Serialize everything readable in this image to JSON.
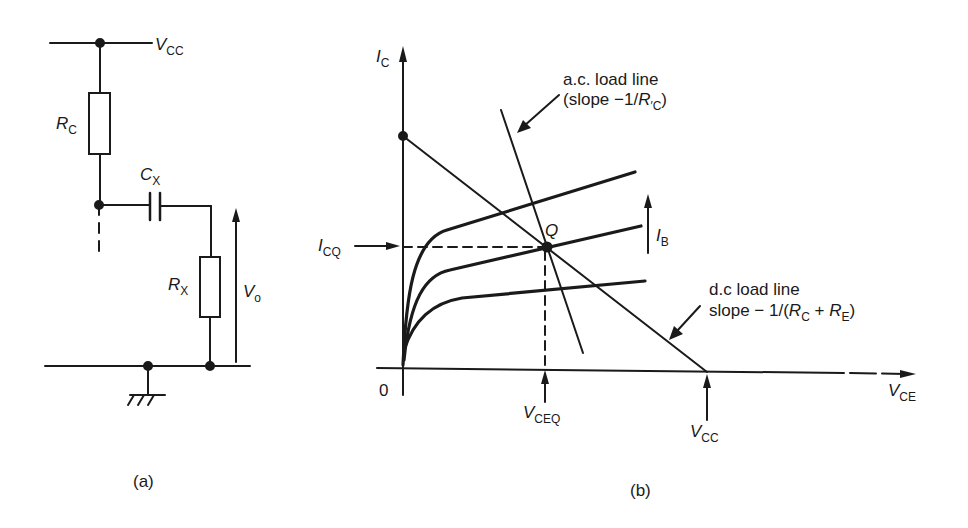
{
  "figure_a": {
    "caption": "(a)",
    "labels": {
      "vcc": {
        "main": "V",
        "sub": "CC"
      },
      "rc": {
        "main": "R",
        "sub": "C"
      },
      "cx": {
        "main": "C",
        "sub": "X"
      },
      "rx": {
        "main": "R",
        "sub": "X"
      },
      "vo": {
        "main": "V",
        "sub": "o"
      }
    }
  },
  "figure_b": {
    "caption": "(b)",
    "axes": {
      "y": {
        "main": "I",
        "sub": "C"
      },
      "x": {
        "main": "V",
        "sub": "CE"
      },
      "origin": "0"
    },
    "labels": {
      "icq": {
        "main": "I",
        "sub": "CQ"
      },
      "q_point": "Q",
      "ib": {
        "main": "I",
        "sub": "B"
      },
      "vceq": {
        "main": "V",
        "sub": "CEQ"
      },
      "vcc": {
        "main": "V",
        "sub": "CC"
      },
      "ac_line_1": "a.c. load line",
      "ac_line_2_pre": "(slope  −1/",
      "ac_line_2_r": "R",
      "ac_line_2_sub": "′C",
      "ac_line_2_post": ")",
      "dc_line_1": "d.c load line",
      "dc_line_2_pre": "slope − 1/(",
      "dc_line_2_r1": "R",
      "dc_line_2_s1": "C",
      "dc_line_2_mid": " + ",
      "dc_line_2_r2": "R",
      "dc_line_2_s2": "E",
      "dc_line_2_post": ")"
    }
  },
  "colors": {
    "ink": "#1a1a1a",
    "background": "#ffffff"
  }
}
